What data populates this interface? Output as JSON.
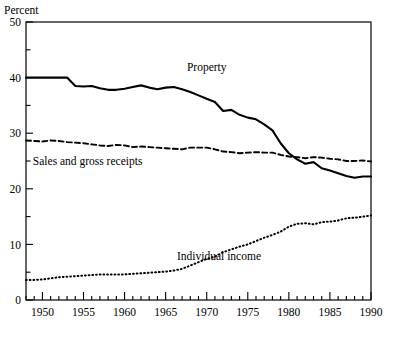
{
  "chart_data": {
    "type": "line",
    "title": "",
    "subtitle": "",
    "ylabel": "Percent",
    "xlabel": "",
    "ylim": [
      0,
      50
    ],
    "xlim": [
      1948,
      1990
    ],
    "grid": false,
    "legend_position": "inline-annotations",
    "y_ticks": [
      0,
      5,
      10,
      15,
      20,
      25,
      30,
      35,
      40,
      45,
      50
    ],
    "y_tick_labels": [
      "0",
      "",
      "10",
      "",
      "20",
      "",
      "30",
      "",
      "40",
      "",
      "50"
    ],
    "x_ticks": [
      1950,
      1955,
      1960,
      1965,
      1970,
      1975,
      1980,
      1985,
      1990
    ],
    "x_tick_labels": [
      "1950",
      "1955",
      "1960",
      "1965",
      "1970",
      "1975",
      "1980",
      "1985",
      "1990"
    ],
    "x_minor_tick_step": 1,
    "x": [
      1948,
      1949,
      1950,
      1951,
      1952,
      1953,
      1954,
      1955,
      1956,
      1957,
      1958,
      1959,
      1960,
      1961,
      1962,
      1963,
      1964,
      1965,
      1966,
      1967,
      1968,
      1969,
      1970,
      1971,
      1972,
      1973,
      1974,
      1975,
      1976,
      1977,
      1978,
      1979,
      1980,
      1981,
      1982,
      1983,
      1984,
      1985,
      1986,
      1987,
      1988,
      1989,
      1990
    ],
    "series": [
      {
        "name": "Property",
        "label": "Property",
        "style": "solid",
        "color": "#000000",
        "label_x": 1970,
        "label_y": 41.2,
        "values": [
          40.0,
          40.0,
          40.0,
          40.0,
          40.0,
          40.0,
          38.5,
          38.4,
          38.5,
          38.1,
          37.8,
          37.8,
          38.0,
          38.3,
          38.6,
          38.2,
          37.9,
          38.2,
          38.3,
          37.9,
          37.4,
          36.8,
          36.2,
          35.6,
          34.0,
          34.2,
          33.3,
          32.8,
          32.5,
          31.6,
          30.5,
          28.2,
          26.4,
          25.3,
          24.5,
          24.8,
          23.7,
          23.3,
          22.8,
          22.3,
          22.0,
          22.2,
          22.2
        ]
      },
      {
        "name": "Sales and gross receipts",
        "label": "Sales and gross receipts",
        "style": "dashed",
        "color": "#000000",
        "label_x": 1955.5,
        "label_y": 24.2,
        "values": [
          28.7,
          28.6,
          28.5,
          28.7,
          28.6,
          28.4,
          28.3,
          28.2,
          28.0,
          27.8,
          27.7,
          27.9,
          27.8,
          27.5,
          27.6,
          27.5,
          27.4,
          27.3,
          27.2,
          27.1,
          27.4,
          27.4,
          27.4,
          27.1,
          26.7,
          26.6,
          26.4,
          26.5,
          26.6,
          26.5,
          26.5,
          26.1,
          25.8,
          25.7,
          25.5,
          25.7,
          25.6,
          25.4,
          25.3,
          25.0,
          25.0,
          25.1,
          24.9
        ]
      },
      {
        "name": "Individual income",
        "label": "Individual income",
        "style": "dotted",
        "color": "#000000",
        "label_x": 1971.5,
        "label_y": 7.2,
        "values": [
          3.6,
          3.6,
          3.7,
          3.9,
          4.1,
          4.2,
          4.3,
          4.4,
          4.5,
          4.6,
          4.6,
          4.6,
          4.6,
          4.7,
          4.8,
          4.9,
          5.0,
          5.1,
          5.3,
          5.6,
          6.2,
          6.8,
          7.4,
          7.8,
          8.6,
          9.1,
          9.6,
          10.0,
          10.6,
          11.2,
          11.7,
          12.3,
          13.2,
          13.7,
          13.8,
          13.6,
          14.0,
          14.1,
          14.3,
          14.7,
          14.8,
          15.0,
          15.2
        ]
      }
    ]
  }
}
